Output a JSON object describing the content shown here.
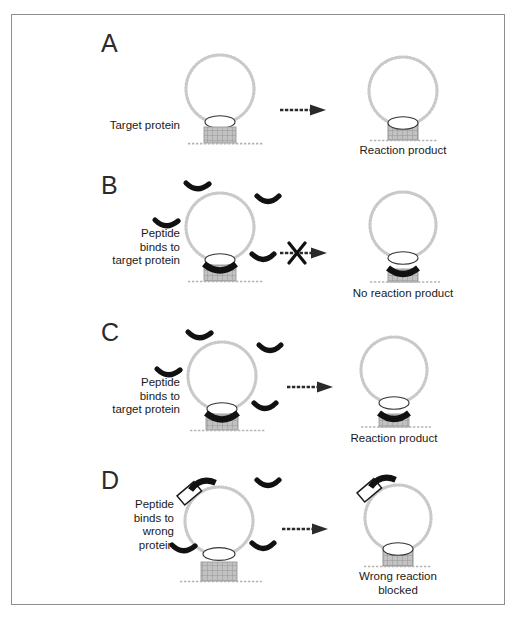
{
  "figure": {
    "title": "",
    "background": "#ffffff",
    "frame_color": "#8e8e8e",
    "accent_peptide_color": "#111111",
    "vesicle_color": "#c9c9c9",
    "protein_color": "#b0b0b0"
  },
  "panels": [
    {
      "letter": "A",
      "left": {
        "label": "Target protein",
        "elements": [
          "vesicle",
          "neck-ellipse",
          "target-protein-box",
          "surface-line"
        ]
      },
      "arrow": {
        "blocked": false,
        "x_mark": ""
      },
      "right": {
        "caption": "Reaction product",
        "elements": [
          "vesicle",
          "fused-cylinder",
          "surface-line"
        ]
      }
    },
    {
      "letter": "B",
      "left": {
        "label": "Peptide\nbinds to\ntarget protein",
        "label_lines": [
          "Peptide",
          "binds to",
          "target protein"
        ],
        "elements": [
          "vesicle",
          "neck-ellipse",
          "target-protein-box",
          "bound-peptide",
          "free-peptides",
          "surface-line"
        ]
      },
      "arrow": {
        "blocked": true,
        "x_mark": "X"
      },
      "right": {
        "caption": "No reaction product",
        "elements": [
          "vesicle",
          "neck-ellipse",
          "target-protein-box",
          "bound-peptide",
          "surface-line"
        ]
      }
    },
    {
      "letter": "C",
      "left": {
        "label": "Peptide\nbinds to\ntarget protein",
        "label_lines": [
          "Peptide",
          "binds to",
          "target protein"
        ],
        "elements": [
          "vesicle",
          "neck-ellipse",
          "target-protein-box",
          "bound-peptide",
          "free-peptides",
          "surface-line"
        ]
      },
      "arrow": {
        "blocked": false,
        "x_mark": ""
      },
      "right": {
        "caption": "Reaction product",
        "elements": [
          "vesicle",
          "neck-ellipse",
          "target-protein-box",
          "bound-peptide",
          "surface-line"
        ]
      }
    },
    {
      "letter": "D",
      "left": {
        "label": "Peptide\nbinds to\nwrong\nprotein",
        "label_lines": [
          "Peptide",
          "binds to",
          "wrong",
          "protein"
        ],
        "elements": [
          "vesicle",
          "neck-ellipse",
          "wrong-protein",
          "bound-peptide-wrong",
          "free-peptides",
          "target-protein-box",
          "surface-line"
        ]
      },
      "arrow": {
        "blocked": false,
        "x_mark": ""
      },
      "right": {
        "caption_lines": [
          "Wrong reaction",
          "blocked"
        ],
        "caption": "Wrong reaction\nblocked",
        "elements": [
          "vesicle",
          "wrong-protein",
          "bound-peptide-wrong",
          "fused-cylinder",
          "surface-line"
        ]
      }
    }
  ],
  "icons": {
    "arrow": "right-arrow-icon",
    "x_block": "x-block-icon",
    "vesicle": "vesicle-circle-icon",
    "peptide": "peptide-arc-icon",
    "protein": "protein-box-icon"
  }
}
